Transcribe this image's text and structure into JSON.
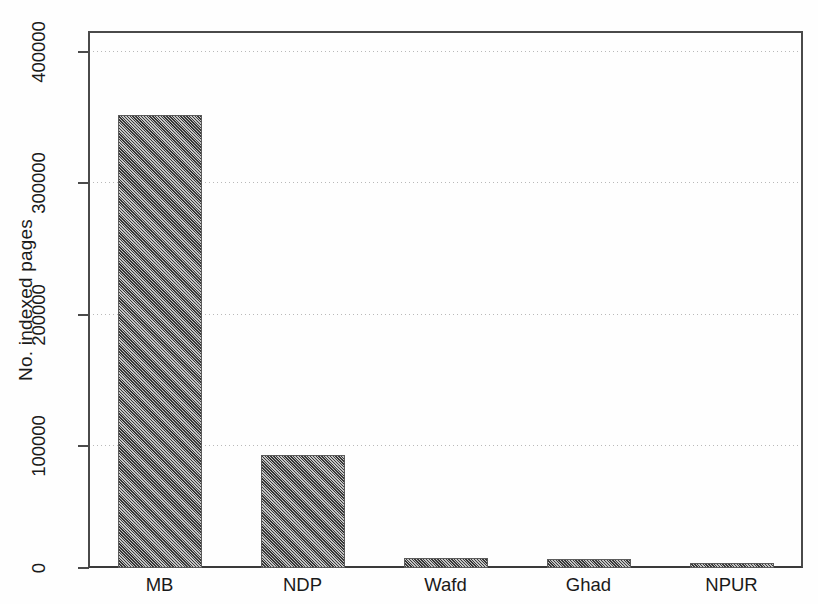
{
  "chart_data": {
    "type": "bar",
    "title": "",
    "subtitle": "",
    "xlabel": "",
    "ylabel": "No. indexed pages",
    "categories": [
      "MB",
      "NDP",
      "Wafd",
      "Ghad",
      "NPUR"
    ],
    "values": [
      346000,
      86000,
      8000,
      7000,
      4000
    ],
    "ylim": [
      0,
      410000
    ],
    "yticks": [
      0,
      100000,
      200000,
      300000,
      400000
    ],
    "ytick_labels": [
      "0",
      "100000",
      "200000",
      "300000",
      "400000"
    ],
    "grid": "horizontal-dotted",
    "legend": "none",
    "bar_color": "#7d7d7d",
    "bar_edge_color": "#5c5c5c",
    "axis_color": "#4a4a4a",
    "grid_color": "#b9b9b9",
    "background_color": "#ffffff"
  }
}
